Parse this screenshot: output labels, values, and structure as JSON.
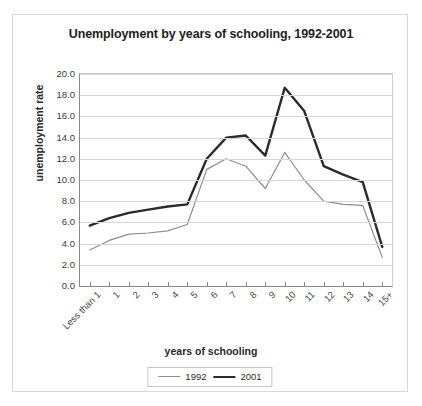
{
  "chart_data": {
    "type": "line",
    "title": "Unemployment by years of schooling, 1992-2001",
    "xlabel": "years of schooling",
    "ylabel": "unemployment rate",
    "ylim": [
      0,
      20
    ],
    "ytick_step": 2,
    "yticks": [
      "20.0",
      "18.0",
      "16.0",
      "14.0",
      "12.0",
      "10.0",
      "8.0",
      "6.0",
      "4.0",
      "2.0",
      "0.0"
    ],
    "grid": true,
    "legend_position": "bottom-center",
    "categories": [
      "Less than 1",
      "1",
      "2",
      "3",
      "4",
      "5",
      "6",
      "7",
      "8",
      "9",
      "10",
      "11",
      "12",
      "13",
      "14",
      "15+"
    ],
    "series": [
      {
        "name": "1992",
        "color": "#8d8d8d",
        "width": 1.2,
        "values": [
          3.4,
          4.3,
          4.9,
          5.0,
          5.2,
          5.8,
          11.0,
          12.0,
          11.3,
          9.2,
          12.6,
          10.0,
          8.0,
          7.7,
          7.6,
          2.7
        ]
      },
      {
        "name": "2001",
        "color": "#2b2b2b",
        "width": 2.4,
        "values": [
          5.7,
          6.4,
          6.9,
          7.2,
          7.5,
          7.7,
          12.0,
          14.0,
          14.2,
          12.3,
          18.7,
          16.5,
          11.3,
          10.5,
          9.8,
          3.7
        ]
      }
    ]
  },
  "legend": {
    "items": [
      {
        "label": "1992"
      },
      {
        "label": "2001"
      }
    ]
  }
}
